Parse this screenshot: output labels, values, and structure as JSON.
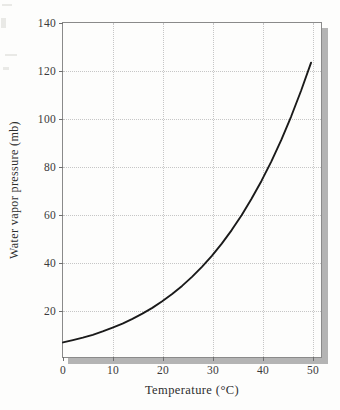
{
  "figure": {
    "background_color": "#fdfdfc",
    "frame_color": "#8a8a8a",
    "grid_color": "#c6c6c6",
    "curve_color": "#1a1a1a",
    "shadow_color": "#b4b4b4"
  },
  "chart_data": {
    "type": "line",
    "title": "",
    "xlabel": "Temperature (°C)",
    "ylabel": "Water vapor pressure (mb)",
    "xlim": [
      0,
      52
    ],
    "ylim": [
      0,
      140
    ],
    "xticks": [
      0,
      10,
      20,
      30,
      40,
      50
    ],
    "xtick_labels": [
      "0",
      "10",
      "20",
      "30",
      "40",
      "50"
    ],
    "yticks": [
      20,
      40,
      60,
      80,
      100,
      120,
      140
    ],
    "ytick_labels": [
      "20",
      "40",
      "60",
      "80",
      "100",
      "120",
      "140"
    ],
    "grid": true,
    "grid_style": "dotted",
    "legend": "none",
    "series": [
      {
        "name": "Saturation water vapor pressure",
        "x": [
          0,
          2,
          4,
          6,
          8,
          10,
          12,
          14,
          16,
          18,
          20,
          22,
          24,
          26,
          28,
          30,
          32,
          34,
          36,
          38,
          40,
          42,
          44,
          46,
          48,
          50
        ],
        "values": [
          6.1,
          7.1,
          8.1,
          9.3,
          10.7,
          12.3,
          14.0,
          16.0,
          18.2,
          20.6,
          23.4,
          26.4,
          29.8,
          33.6,
          37.8,
          42.4,
          47.5,
          53.2,
          59.4,
          66.3,
          73.8,
          82.0,
          91.0,
          100.9,
          111.7,
          123.4
        ]
      }
    ]
  }
}
